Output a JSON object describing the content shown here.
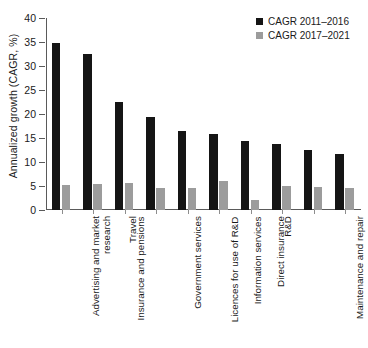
{
  "chart_data": {
    "type": "bar",
    "title": "",
    "subtitle": "",
    "xlabel": "",
    "ylabel": "Annualized growth (CAGR, %)",
    "ylim": [
      0,
      40
    ],
    "ytick_labels": [
      "0",
      "5",
      "10",
      "15",
      "20",
      "25",
      "30",
      "35",
      "40"
    ],
    "ytick_values": [
      0,
      5,
      10,
      15,
      20,
      25,
      30,
      35,
      40
    ],
    "grid": false,
    "legend_position": "top-right",
    "categories": [
      "Advertising and market research",
      "Insurance and pensions",
      "Travel",
      "Government services",
      "Licences for use of R&D",
      "Information services",
      "Direct insurance",
      "R&D",
      "Maintenance and repair",
      "Charges for use of IP"
    ],
    "category_lines": [
      [
        "Advertising and market",
        "research"
      ],
      [
        "Insurance and pensions"
      ],
      [
        "Travel"
      ],
      [
        "Government services"
      ],
      [
        "Licences for use of R&D"
      ],
      [
        "Information services"
      ],
      [
        "Direct insurance"
      ],
      [
        "R&D"
      ],
      [
        "Maintenance and repair"
      ],
      [
        "Charges for use of IP"
      ]
    ],
    "series": [
      {
        "name": "CAGR 2011–2016",
        "color": "#151515",
        "values": [
          34.8,
          32.4,
          22.5,
          19.3,
          16.5,
          15.8,
          14.4,
          13.8,
          12.6,
          11.7
        ]
      },
      {
        "name": "CAGR 2017–2021",
        "color": "#9c9c9c",
        "values": [
          5.2,
          5.5,
          5.7,
          4.6,
          4.6,
          6.0,
          2.0,
          5.0,
          4.7,
          4.6
        ]
      }
    ]
  },
  "legend": {
    "items": [
      {
        "label": "CAGR 2011–2016",
        "color": "#151515"
      },
      {
        "label": "CAGR 2017–2021",
        "color": "#9c9c9c"
      }
    ]
  },
  "axes": {
    "y_title": "Annualized growth (CAGR, %)"
  }
}
